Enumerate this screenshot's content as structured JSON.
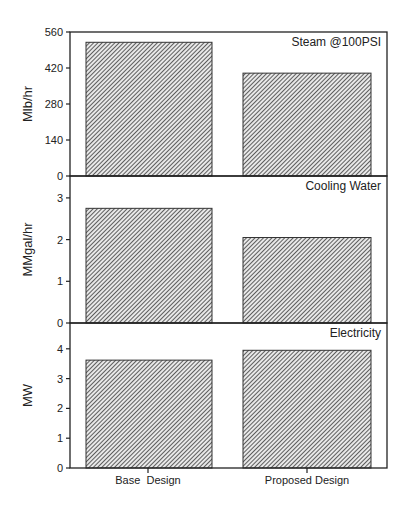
{
  "chart_data": {
    "type": "bar",
    "layout": "three vertically stacked panels sharing x-axis",
    "categories": [
      "Base  Design",
      "Proposed Design"
    ],
    "panels": [
      {
        "title": "Steam @100PSI",
        "ylabel": "Mlb/hr",
        "ylim": [
          0,
          560
        ],
        "yticks": [
          0,
          140,
          280,
          420,
          560
        ],
        "values": [
          520,
          400
        ]
      },
      {
        "title": "Cooling Water",
        "ylabel": "MMgal/hr",
        "ylim": [
          0,
          3.3
        ],
        "yticks": [
          0,
          1,
          2,
          3
        ],
        "values": [
          2.75,
          2.05
        ]
      },
      {
        "title": "Electricity",
        "ylabel": "MW",
        "ylim": [
          0,
          4.6
        ],
        "yticks": [
          0,
          1,
          2,
          3,
          4
        ],
        "values": [
          3.62,
          3.95
        ]
      }
    ],
    "xlabel": "",
    "grid": false,
    "legend": "none",
    "bar_fill": "diagonal hatch",
    "colors": {
      "bar_hatch": "#333333",
      "axis": "#222222",
      "background": "#ffffff"
    }
  }
}
